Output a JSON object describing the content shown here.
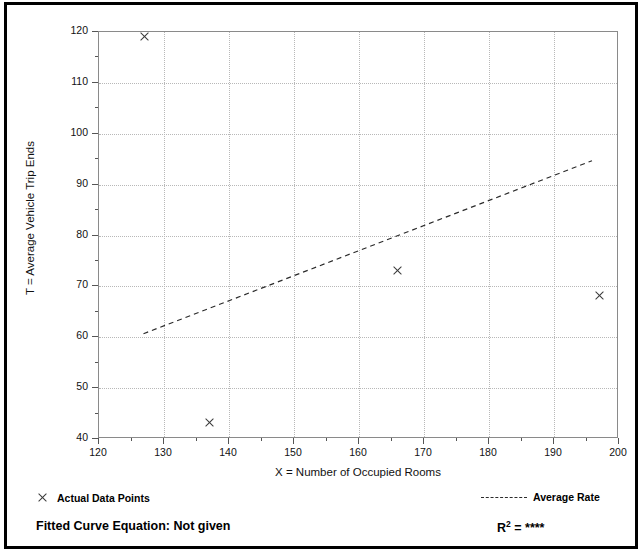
{
  "chart_data": {
    "type": "scatter",
    "title": "",
    "xlabel": "X = Number of Occupied Rooms",
    "ylabel": "T = Average Vehicle Trip Ends",
    "xlim": [
      120,
      200
    ],
    "ylim": [
      40,
      120
    ],
    "x_ticks": [
      120,
      130,
      140,
      150,
      160,
      170,
      180,
      190,
      200
    ],
    "y_ticks": [
      40,
      50,
      60,
      70,
      80,
      90,
      100,
      110,
      120
    ],
    "x_minor_step": 5,
    "y_minor_step": 5,
    "grid": true,
    "series": [
      {
        "name": "Actual Data Points",
        "type": "scatter",
        "marker": "x",
        "points": [
          {
            "x": 127,
            "y": 119
          },
          {
            "x": 137,
            "y": 43
          },
          {
            "x": 166,
            "y": 73
          },
          {
            "x": 197,
            "y": 68
          }
        ]
      },
      {
        "name": "Average Rate",
        "type": "line",
        "style": "dashed",
        "points": [
          {
            "x": 127,
            "y": 60.5
          },
          {
            "x": 196,
            "y": 94.5
          }
        ]
      }
    ],
    "annotations": {
      "fitted_curve_equation": "Fitted Curve Equation:  Not given",
      "r_squared_label": "R",
      "r_squared_exponent": "2",
      "r_squared_value": "= ****"
    }
  },
  "legend": {
    "position": "below-axes",
    "entries": [
      {
        "label": "Actual Data Points",
        "symbol": "x-marker"
      },
      {
        "label": "Average Rate",
        "symbol": "dashed-line"
      }
    ]
  },
  "colors": {
    "frame": "#000000",
    "plot_border": "#8a8a8a",
    "gridline": "#b8b8b8",
    "marker": "#3a3a3a",
    "trendline": "#2b2b2b",
    "text": "#111111",
    "background": "#ffffff"
  }
}
